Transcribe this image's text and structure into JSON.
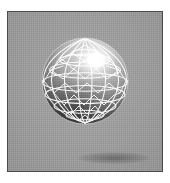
{
  "figure": {
    "kind": "geodesic-sphere-render",
    "caption": "",
    "background_color": "#9c9c9c",
    "border_color": "#4b4b4b",
    "page_color": "#ffffff"
  },
  "sphere": {
    "name": "geodesic-sphere",
    "wireframe_color": "#ffffff",
    "highlight_color": "#ffffff",
    "shadow_color": "#0a0a0a",
    "surface_light": "#f2f2f2",
    "surface_mid": "#8a8a8a",
    "surface_dark": "#141414",
    "center_x": 47,
    "center_y": 55,
    "radius": 43,
    "highlight_x": 58,
    "highlight_y": 34,
    "latitude_bands": 7,
    "longitude_segments": 12,
    "facet_type": "triangle"
  },
  "geometry": {
    "latitudes": [
      -72,
      -48,
      -24,
      0,
      24,
      48,
      72
    ],
    "longitude_count": 12,
    "tilt_degrees": 12
  }
}
